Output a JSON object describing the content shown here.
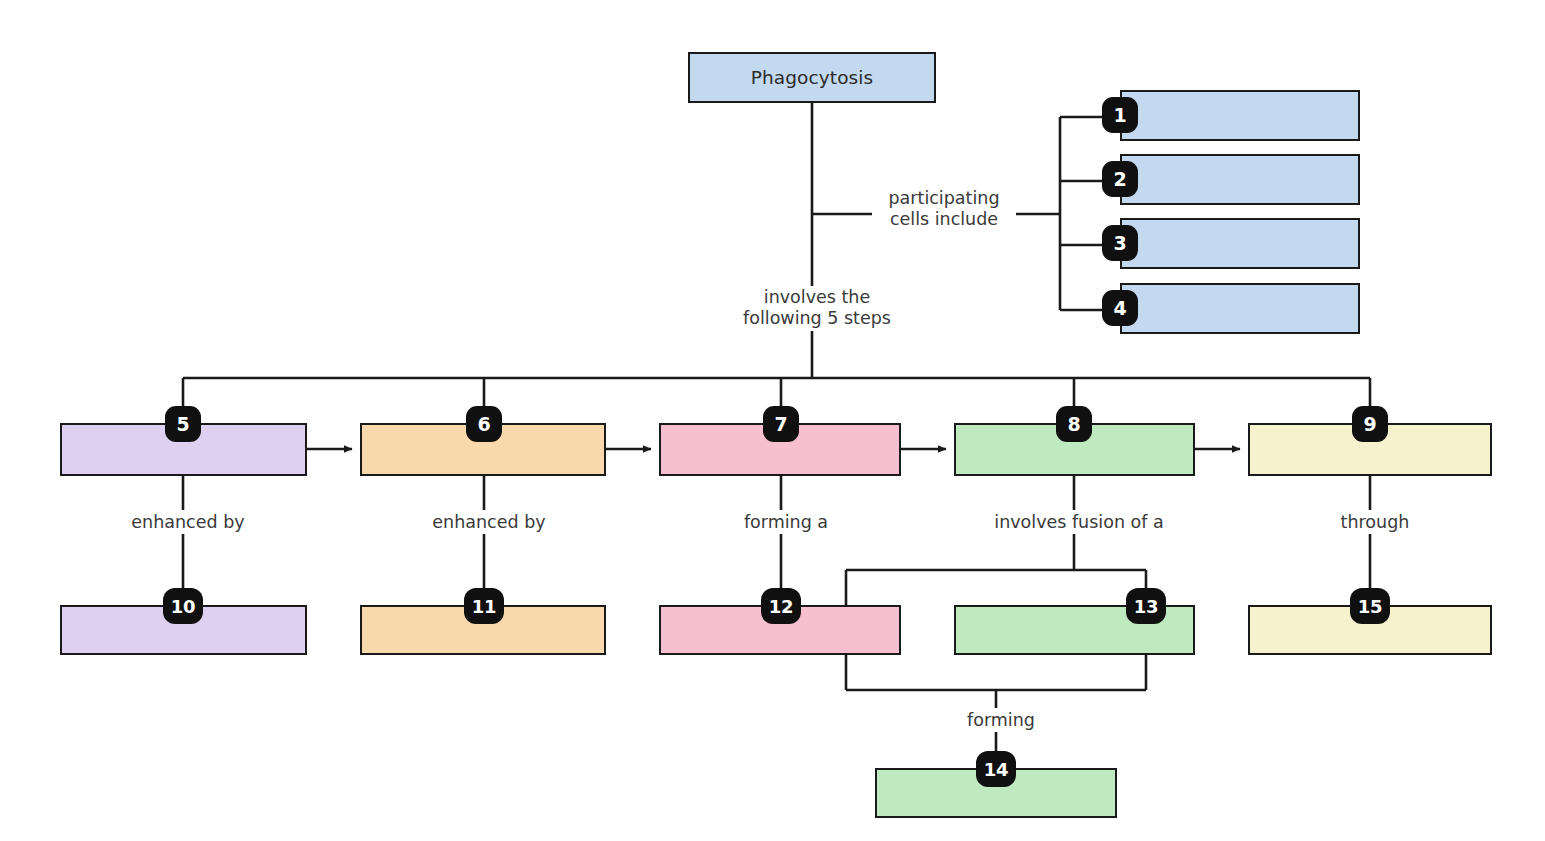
{
  "diagram": {
    "title_node": {
      "label": "Phagocytosis",
      "fill": "#c3d9f0"
    },
    "link_labels": [
      {
        "id": "participating",
        "text": "participating\ncells include"
      },
      {
        "id": "five-steps",
        "text": "involves the\nfollowing 5 steps"
      },
      {
        "id": "enhanced-by-5",
        "text": "enhanced by"
      },
      {
        "id": "enhanced-by-6",
        "text": "enhanced by"
      },
      {
        "id": "forming-a-7",
        "text": "forming a"
      },
      {
        "id": "fusion-8",
        "text": "involves fusion of a"
      },
      {
        "id": "through-9",
        "text": "through"
      },
      {
        "id": "forming-14",
        "text": "forming"
      }
    ],
    "boxes": [
      {
        "number": "1",
        "label": "",
        "fill": "#c3d9f0",
        "badge_pos": "left"
      },
      {
        "number": "2",
        "label": "",
        "fill": "#c3d9f0",
        "badge_pos": "left"
      },
      {
        "number": "3",
        "label": "",
        "fill": "#c3d9f0",
        "badge_pos": "left"
      },
      {
        "number": "4",
        "label": "",
        "fill": "#c3d9f0",
        "badge_pos": "left"
      },
      {
        "number": "5",
        "label": "",
        "fill": "#ddd0f0",
        "badge_pos": "top"
      },
      {
        "number": "6",
        "label": "",
        "fill": "#f8d9ac",
        "badge_pos": "top"
      },
      {
        "number": "7",
        "label": "",
        "fill": "#f7bfcf",
        "badge_pos": "top"
      },
      {
        "number": "8",
        "label": "",
        "fill": "#bfe9bf",
        "badge_pos": "top"
      },
      {
        "number": "9",
        "label": "",
        "fill": "#f7f2ce",
        "badge_pos": "top"
      },
      {
        "number": "10",
        "label": "",
        "fill": "#ddd0f0",
        "badge_pos": "top"
      },
      {
        "number": "11",
        "label": "",
        "fill": "#f8d9ac",
        "badge_pos": "top"
      },
      {
        "number": "12",
        "label": "",
        "fill": "#f7bfcf",
        "badge_pos": "top"
      },
      {
        "number": "13",
        "label": "",
        "fill": "#bfe9bf",
        "badge_pos": "top"
      },
      {
        "number": "14",
        "label": "",
        "fill": "#bfe9bf",
        "badge_pos": "top"
      },
      {
        "number": "15",
        "label": "",
        "fill": "#f7f2ce",
        "badge_pos": "top"
      }
    ],
    "colors": {
      "line": "#1a1a1a",
      "background": "#ffffff",
      "badge": "#101010",
      "text": "#2b2b2b"
    }
  }
}
